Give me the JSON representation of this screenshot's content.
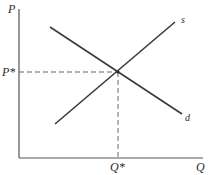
{
  "diagram": {
    "type": "supply-demand",
    "colors": {
      "axis": "#555555",
      "curve": "#3a3a3a",
      "dashed": "#666666",
      "text": "#2a2a2a",
      "background": "#ffffff"
    },
    "axes": {
      "y_label": "P",
      "x_label": "Q"
    },
    "equilibrium": {
      "price_label": "P*",
      "quantity_label": "Q*"
    },
    "curves": [
      {
        "name": "supply",
        "label": "s"
      },
      {
        "name": "demand",
        "label": "d"
      }
    ]
  }
}
